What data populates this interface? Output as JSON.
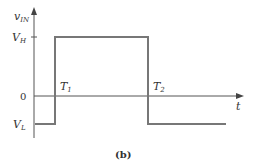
{
  "diagram": {
    "y_axis_label_main": "v",
    "y_axis_label_sub": "IN",
    "x_axis_label": "t",
    "levels": {
      "high_main": "V",
      "high_sub": "H",
      "zero": "0",
      "low_main": "V",
      "low_sub": "L"
    },
    "times": {
      "t1_main": "T",
      "t1_sub": "1",
      "t2_main": "T",
      "t2_sub": "2"
    },
    "caption": "(b)",
    "waveform": {
      "type": "pulse",
      "segments": [
        "V_L before T1",
        "V_H from T1 to T2",
        "V_L after T2"
      ]
    },
    "colors": {
      "axis": "#555555",
      "signal": "#777777",
      "text": "#333333"
    }
  }
}
